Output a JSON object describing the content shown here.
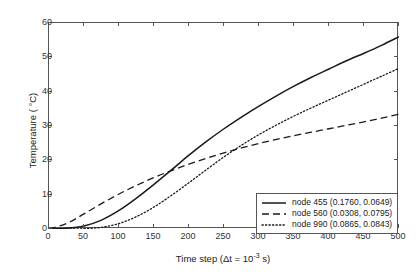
{
  "chart_data": {
    "type": "line",
    "title": "",
    "xlabel": "Time step (Δt = 10⁻³ s)",
    "xlabel_main": "Time step (Δt = 10",
    "xlabel_exp": "-3",
    "xlabel_tail": " s)",
    "ylabel": "Temperature ( °C)",
    "xlim": [
      0,
      500
    ],
    "ylim": [
      0,
      60
    ],
    "xticks": [
      0,
      50,
      100,
      150,
      200,
      250,
      300,
      350,
      400,
      450,
      500
    ],
    "yticks": [
      0,
      10,
      20,
      30,
      40,
      50,
      60
    ],
    "grid": false,
    "legend_position": "lower right",
    "x": [
      0,
      25,
      50,
      75,
      100,
      125,
      150,
      175,
      200,
      225,
      250,
      275,
      300,
      325,
      350,
      375,
      400,
      425,
      450,
      475,
      500
    ],
    "series": [
      {
        "name": "node 455 (0.1760, 0.0649)",
        "label": "node 455",
        "coords": "(0.1760, 0.0649)",
        "style": "solid",
        "color": "#1a1a1a",
        "values": [
          0.0,
          0.2,
          0.9,
          2.6,
          5.4,
          9.0,
          13.0,
          17.2,
          21.5,
          25.5,
          29.2,
          32.6,
          35.8,
          38.8,
          41.6,
          44.2,
          46.6,
          49.0,
          51.2,
          53.5,
          56.0
        ]
      },
      {
        "name": "node 560 (0.0308, 0.0795)",
        "label": "node 560",
        "coords": "(0.0308, 0.0795)",
        "style": "dashed",
        "color": "#1a1a1a",
        "values": [
          0.0,
          1.6,
          4.4,
          7.4,
          10.2,
          12.7,
          15.0,
          17.0,
          18.9,
          20.6,
          22.2,
          23.6,
          24.9,
          26.1,
          27.2,
          28.2,
          29.2,
          30.2,
          31.2,
          32.3,
          33.4
        ]
      },
      {
        "name": "node 990 (0.0865, 0.0843)",
        "label": "node 990",
        "coords": "(0.0865, 0.0843)",
        "style": "dotted",
        "color": "#1a1a1a",
        "values": [
          0.0,
          0.0,
          0.1,
          0.5,
          1.6,
          3.6,
          6.4,
          9.8,
          13.5,
          17.3,
          21.0,
          24.4,
          27.5,
          30.3,
          32.9,
          35.3,
          37.6,
          39.9,
          42.2,
          44.5,
          46.8
        ]
      }
    ]
  }
}
